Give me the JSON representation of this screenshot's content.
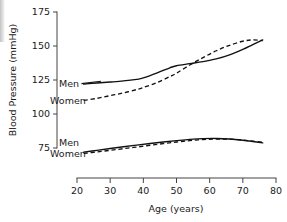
{
  "figure": {
    "name": "blood-pressure-vs-age-chart",
    "background": "#ffffff",
    "ink_color": "#111111"
  },
  "axes": {
    "x": {
      "label": "Age (years)",
      "ticks": [
        20,
        30,
        40,
        50,
        60,
        70,
        80
      ],
      "tick_labels": [
        "20",
        "30",
        "40",
        "50",
        "60",
        "70",
        "80"
      ],
      "min": 20,
      "max": 80,
      "grid": false
    },
    "y": {
      "label": "Blood Pressure (mmHg)",
      "ticks": [
        75,
        100,
        125,
        150,
        175
      ],
      "tick_labels": [
        "75",
        "100",
        "125",
        "150",
        "175"
      ],
      "min": 75,
      "max": 175,
      "grid": false
    }
  },
  "annotations": {
    "systolic_men": "Men",
    "systolic_women": "Women",
    "diastolic_men": "Men",
    "diastolic_women": "Women"
  },
  "chart_data": {
    "type": "line",
    "title": "",
    "xlabel": "Age (years)",
    "ylabel": "Blood Pressure (mmHg)",
    "xlim": [
      20,
      80
    ],
    "ylim": [
      75,
      175
    ],
    "grid": false,
    "legend_position": "inline-annotations",
    "series": [
      {
        "name": "Systolic Men",
        "style": "solid",
        "color": "#111111",
        "x": [
          22,
          26,
          30,
          34,
          38,
          40,
          44,
          48,
          50,
          54,
          58,
          62,
          66,
          70,
          73,
          76
        ],
        "y": [
          122,
          122.8,
          123.5,
          124.3,
          125.5,
          126.5,
          130,
          134,
          135.5,
          137,
          138.5,
          140.5,
          143.5,
          147.5,
          151,
          154.5
        ]
      },
      {
        "name": "Systolic Women",
        "style": "dashed",
        "color": "#111111",
        "x": [
          22,
          26,
          30,
          34,
          38,
          40,
          44,
          48,
          50,
          54,
          58,
          62,
          66,
          70,
          73,
          76
        ],
        "y": [
          110,
          111.5,
          113.5,
          115.5,
          118,
          119.5,
          123,
          127.5,
          130,
          136,
          141.5,
          146.5,
          150.5,
          153.5,
          154.5,
          154
        ]
      },
      {
        "name": "Diastolic Men",
        "style": "solid",
        "color": "#111111",
        "x": [
          22,
          26,
          30,
          34,
          38,
          42,
          46,
          50,
          54,
          58,
          62,
          66,
          70,
          73,
          76
        ],
        "y": [
          72,
          73.3,
          74.6,
          75.9,
          77.1,
          78.3,
          79.4,
          80.4,
          81.3,
          81.9,
          82,
          81.6,
          80.7,
          79.8,
          78.8
        ]
      },
      {
        "name": "Diastolic Women",
        "style": "dashed",
        "color": "#111111",
        "x": [
          22,
          26,
          30,
          34,
          38,
          42,
          46,
          50,
          54,
          58,
          62,
          66,
          70,
          73,
          76
        ],
        "y": [
          71,
          72.1,
          73.3,
          74.5,
          75.7,
          77.0,
          78.2,
          79.4,
          80.4,
          81.2,
          81.6,
          81.5,
          80.8,
          80.1,
          79.2
        ]
      }
    ]
  }
}
